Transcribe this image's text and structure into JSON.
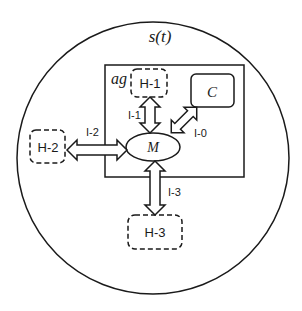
{
  "diagram": {
    "environment_label": "s(t)",
    "agent_label": "ag",
    "core": {
      "label": "M"
    },
    "component": {
      "label": "C"
    },
    "humans": [
      {
        "id": "h1",
        "label": "H-1"
      },
      {
        "id": "h2",
        "label": "H-2"
      },
      {
        "id": "h3",
        "label": "H-3"
      }
    ],
    "interfaces": [
      {
        "id": "i0",
        "label": "I-0",
        "connects": [
          "M",
          "C"
        ]
      },
      {
        "id": "i1",
        "label": "I-1",
        "connects": [
          "M",
          "H-1"
        ]
      },
      {
        "id": "i2",
        "label": "I-2",
        "connects": [
          "M",
          "H-2"
        ]
      },
      {
        "id": "i3",
        "label": "I-3",
        "connects": [
          "M",
          "H-3"
        ]
      }
    ]
  }
}
